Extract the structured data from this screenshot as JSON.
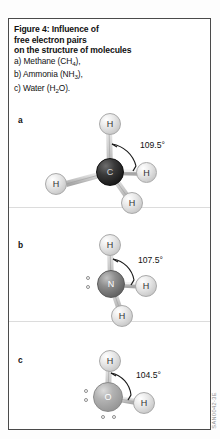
{
  "figure": {
    "caption_bold_lines": [
      "Figure 4: Influence of",
      "free electron pairs",
      "on the structure of molecules"
    ],
    "caption_items": [
      {
        "prefix": "a) Methane (CH",
        "sub": "4",
        "suffix": "),"
      },
      {
        "prefix": "b) Ammonia (NH",
        "sub": "3",
        "suffix": "),"
      },
      {
        "prefix": "c) Water (H",
        "sub": "2",
        "suffix": "O)."
      }
    ],
    "watermark": "SAN0042-3E"
  },
  "panels": [
    {
      "letter": "a",
      "name": "methane",
      "center_atom": "C",
      "angle_label": "109.5°",
      "hydrogens": [
        "H",
        "H",
        "H",
        "H"
      ],
      "electron_pairs": 0
    },
    {
      "letter": "b",
      "name": "ammonia",
      "center_atom": "N",
      "angle_label": "107.5°",
      "hydrogens": [
        "H",
        "H",
        "H"
      ],
      "electron_pairs": 1
    },
    {
      "letter": "c",
      "name": "water",
      "center_atom": "O",
      "angle_label": "104.5°",
      "hydrogens": [
        "H",
        "H"
      ],
      "electron_pairs": 2
    }
  ],
  "colors": {
    "frame": "#4a4a4a",
    "carbon": "#1d1d1d",
    "nitrogen": "#676767",
    "oxygen": "#9a9a9a",
    "hydrogen": "#d8d8d8",
    "text": "#111111"
  }
}
